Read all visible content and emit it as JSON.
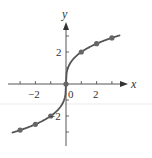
{
  "chart_data": {
    "type": "line",
    "title": "",
    "xlabel": "x",
    "ylabel": "y",
    "function": "y = 2·∛x",
    "xlim": [
      -3.5,
      3.5
    ],
    "ylim": [
      -3,
      3
    ],
    "x_ticks": [
      -3,
      -2,
      -1,
      0,
      1,
      2,
      3
    ],
    "y_ticks": [
      -3,
      -2,
      -1,
      1,
      2,
      3
    ],
    "x_tick_labels": [
      "-2",
      "0",
      "2"
    ],
    "y_tick_labels": [
      "2",
      "-2"
    ],
    "points": [
      {
        "x": -3,
        "y": -2.88
      },
      {
        "x": -2,
        "y": -2.52
      },
      {
        "x": -1,
        "y": -2
      },
      {
        "x": 0,
        "y": 0
      },
      {
        "x": 1,
        "y": 2
      },
      {
        "x": 2,
        "y": 2.52
      },
      {
        "x": 3,
        "y": 2.88
      }
    ],
    "grid": false,
    "legend": null
  },
  "labels": {
    "x_axis": "x",
    "y_axis": "y",
    "x_neg2": "−2",
    "x_0": "0",
    "x_2": "2",
    "y_2": "2",
    "y_neg2": "−2"
  },
  "colors": {
    "curve": "#555555",
    "axes": "#444444",
    "points": "#666666"
  }
}
